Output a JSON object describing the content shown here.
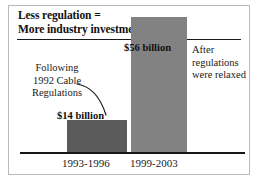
{
  "chart_data": {
    "type": "bar",
    "title": "Less regulation = More industry investment",
    "title_lines": [
      "Less regulation =",
      "More industry investment"
    ],
    "categories": [
      "1993-1996",
      "1999-2003"
    ],
    "values": [
      14,
      56
    ],
    "value_labels": [
      "$14 billion",
      "$56 billion"
    ],
    "unit": "billion USD",
    "xlabel": "",
    "ylabel": "",
    "ylim": [
      0,
      62
    ],
    "grid": false,
    "legend": "none",
    "series": [
      {
        "name": "Industry investment",
        "values": [
          14,
          56
        ]
      }
    ],
    "annotations": [
      {
        "name": "left-annotation",
        "lines": [
          "Following",
          "1992 Cable",
          "Regulations"
        ],
        "target_category": "1993-1996",
        "has_leader_line": true
      },
      {
        "name": "right-annotation",
        "lines": [
          "After",
          "regulations",
          "were relaxed"
        ],
        "target_category": "1999-2003",
        "has_leader_line": false
      }
    ],
    "bar_colors": [
      "#5b5b5b",
      "#828282"
    ],
    "axis_color": "#15161a",
    "text_color": "#1a1a1a",
    "background": "#ffffff",
    "frame_color": "#b9b9b9"
  }
}
